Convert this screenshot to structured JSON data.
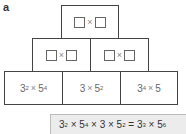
{
  "label": "a",
  "pyramid": {
    "top": {
      "left_placeholder": "",
      "operator": "×",
      "right_placeholder": ""
    },
    "middle": [
      {
        "left_placeholder": "",
        "operator": "×",
        "right_placeholder": ""
      },
      {
        "left_placeholder": "",
        "operator": "×",
        "right_placeholder": ""
      }
    ],
    "bottom": [
      {
        "base1": "3",
        "exp1": "2",
        "op": "×",
        "base2": "5",
        "exp2": "4"
      },
      {
        "base1": "3",
        "exp1": "",
        "op": "×",
        "base2": "5",
        "exp2": "2"
      },
      {
        "base1": "3",
        "exp1": "4",
        "op": "×",
        "base2": "5",
        "exp2": ""
      }
    ]
  },
  "formula": {
    "t1b": "3",
    "t1e": "2",
    "x1": " × ",
    "t2b": "5",
    "t2e": "4",
    "x2": " × ",
    "t3": "3",
    "x3": " × ",
    "t4b": "5",
    "t4e": "2",
    "eq": " = ",
    "r1b": "3",
    "r1e": "3",
    "x4": " × ",
    "r2b": "5",
    "r2e": "6"
  }
}
